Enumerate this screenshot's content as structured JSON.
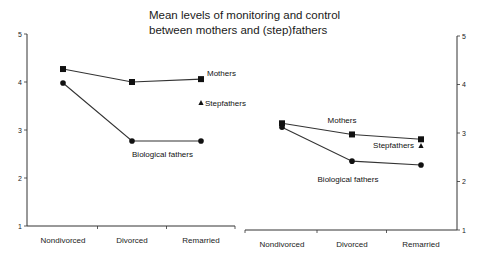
{
  "chart_data": {
    "type": "line",
    "title": "Mean levels of monitoring and control between mothers and (step)fathers",
    "title_lines": [
      "Mean levels of monitoring and control",
      "between mothers and (step)fathers"
    ],
    "ylim": [
      1,
      5
    ],
    "yticks": [
      "1",
      "2",
      "3",
      "4",
      "5"
    ],
    "grid": false,
    "panels": [
      {
        "y_axis_side": "left",
        "categories": [
          "Nondivorced",
          "Divorced",
          "Remarried"
        ],
        "series": [
          {
            "name": "Mothers",
            "marker": "square",
            "values": [
              4.27,
              4.0,
              4.06
            ]
          },
          {
            "name": "Biological fathers",
            "marker": "circle",
            "values": [
              3.98,
              2.77,
              2.77
            ]
          },
          {
            "name": "Stepfathers",
            "marker": "triangle",
            "values": [
              null,
              null,
              3.56
            ]
          }
        ]
      },
      {
        "y_axis_side": "right",
        "categories": [
          "Nondivorced",
          "Divorced",
          "Remarried"
        ],
        "series": [
          {
            "name": "Mothers",
            "marker": "square",
            "values": [
              3.2,
              2.97,
              2.87
            ]
          },
          {
            "name": "Biological fathers",
            "marker": "circle",
            "values": [
              3.12,
              2.42,
              2.34
            ]
          },
          {
            "name": "Stepfathers",
            "marker": "triangle",
            "values": [
              null,
              null,
              2.73
            ]
          }
        ]
      }
    ]
  }
}
